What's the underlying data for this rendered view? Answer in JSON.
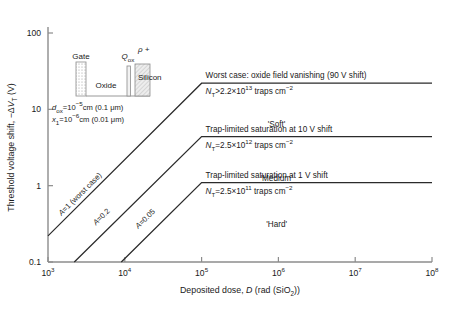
{
  "chart_data": {
    "type": "line",
    "title": "",
    "xlabel": "Deposited dose, D (rad (SiO2))",
    "ylabel": "Threshold voltage shift, −ΔVT (V)",
    "xlabel_parts": {
      "lead": "Deposited dose, ",
      "sym": "D",
      "tail": " (rad (SiO",
      "sub": "2",
      "tail2": "))"
    },
    "ylabel_parts": {
      "lead": "Threshold voltage shift, −Δ",
      "sym": "V",
      "sub": "T",
      "tail": " (V)"
    },
    "xscale": "log",
    "yscale": "log",
    "xlim": [
      1000,
      100000000
    ],
    "ylim": [
      0.1,
      100
    ],
    "grid": false,
    "legend": "none",
    "xticks": [
      {
        "value": 1000,
        "mant": "10",
        "exp": "3"
      },
      {
        "value": 10000,
        "mant": "10",
        "exp": "4"
      },
      {
        "value": 100000,
        "mant": "10",
        "exp": "5"
      },
      {
        "value": 1000000,
        "mant": "10",
        "exp": "6"
      },
      {
        "value": 10000000,
        "mant": "10",
        "exp": "7"
      },
      {
        "value": 100000000,
        "mant": "10",
        "exp": "8"
      }
    ],
    "yticks": [
      {
        "value": 100,
        "label": "100"
      },
      {
        "value": 10,
        "label": "10"
      },
      {
        "value": 1,
        "label": "1"
      },
      {
        "value": 0.1,
        "label": "0.1"
      }
    ],
    "series": [
      {
        "name": "A=1 (worst case)",
        "label": "A=1 (worst case)",
        "points": [
          [
            1000,
            0.22
          ],
          [
            100000,
            22
          ],
          [
            100000000,
            22
          ]
        ],
        "knee": {
          "x": 100000,
          "y": 22
        }
      },
      {
        "name": "A=0.2",
        "label": "A=0.2",
        "points": [
          [
            2200,
            0.1
          ],
          [
            100000,
            4.4
          ],
          [
            100000000,
            4.4
          ]
        ],
        "knee": {
          "x": 100000,
          "y": 4.4
        }
      },
      {
        "name": "A=0.05",
        "label": "A=0.05",
        "points": [
          [
            9000,
            0.1
          ],
          [
            100000,
            1.1
          ],
          [
            100000000,
            1.1
          ]
        ],
        "knee": {
          "x": 100000,
          "y": 1.1
        }
      }
    ],
    "saturation_bands": [
      {
        "id": "soft",
        "headline": "Worst case: oxide field vanishing (90 V shift)",
        "trap_prefix": "N",
        "trap_sub": "T",
        "trap_rel": ">2.2×10",
        "trap_exp": "13",
        "trap_tail": " traps cm",
        "trap_tail_exp": "−2",
        "quality": "'Soft'",
        "y": 22
      },
      {
        "id": "medium",
        "headline": "Trap-limited saturation at 10 V shift",
        "trap_prefix": "N",
        "trap_sub": "T",
        "trap_rel": "=2.5×10",
        "trap_exp": "12",
        "trap_tail": " traps cm",
        "trap_tail_exp": "−2",
        "quality": "'Medium'",
        "y": 4.4
      },
      {
        "id": "hard",
        "headline": "Trap-limited saturation at 1 V shift",
        "trap_prefix": "N",
        "trap_sub": "T",
        "trap_rel": "=2.5×10",
        "trap_exp": "11",
        "trap_tail": " traps cm",
        "trap_tail_exp": "−2",
        "quality": "'Hard'",
        "y": 1.1
      }
    ]
  },
  "inset": {
    "gate_label": "Gate",
    "oxide_label": "Oxide",
    "qox_sym": "Q",
    "qox_sub": "ox",
    "rho_label": "ρ +",
    "silicon_label": "Silicon",
    "param1": {
      "sym": "d",
      "sub": "ox",
      "rest": "=10",
      "exp": "−5",
      "tail": "cm (0.1 μm)"
    },
    "param2": {
      "sym": "x",
      "sub": "1",
      "rest": "=10",
      "exp": "−6",
      "tail": "cm (0.01 μm)"
    }
  },
  "colors": {
    "axis": "#8c8c8c",
    "curve": "#2b2b2b",
    "text": "#1a1a1a",
    "background": "#ffffff",
    "gate_fill": "#e8e8e8",
    "silicon_fill": "#e0e0e0"
  }
}
